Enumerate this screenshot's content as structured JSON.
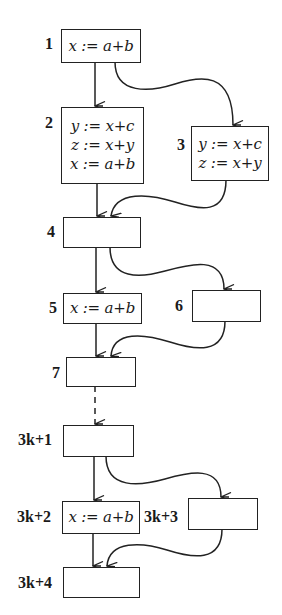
{
  "diagram": {
    "type": "control-flow-graph",
    "colors": {
      "stroke": "#222222",
      "background": "#ffffff",
      "text": "#1a1a1a"
    },
    "blocks": [
      {
        "id": "1",
        "label": "1",
        "statements": [
          "x := a+b"
        ]
      },
      {
        "id": "2",
        "label": "2",
        "statements": [
          "y := x+c",
          "z := x+y",
          "x := a+b"
        ]
      },
      {
        "id": "3",
        "label": "3",
        "statements": [
          "y := x+c",
          "z := x+y"
        ]
      },
      {
        "id": "4",
        "label": "4",
        "statements": []
      },
      {
        "id": "5",
        "label": "5",
        "statements": [
          "x := a+b"
        ]
      },
      {
        "id": "6",
        "label": "6",
        "statements": []
      },
      {
        "id": "7",
        "label": "7",
        "statements": []
      },
      {
        "id": "3k+1",
        "label": "3k+1",
        "statements": []
      },
      {
        "id": "3k+2",
        "label": "3k+2",
        "statements": [
          "x := a+b"
        ]
      },
      {
        "id": "3k+3",
        "label": "3k+3",
        "statements": []
      },
      {
        "id": "3k+4",
        "label": "3k+4",
        "statements": []
      }
    ],
    "edges": [
      {
        "from": "1",
        "to": "2",
        "style": "solid"
      },
      {
        "from": "1",
        "to": "3",
        "style": "solid"
      },
      {
        "from": "2",
        "to": "4",
        "style": "solid"
      },
      {
        "from": "3",
        "to": "4",
        "style": "solid"
      },
      {
        "from": "4",
        "to": "5",
        "style": "solid"
      },
      {
        "from": "4",
        "to": "6",
        "style": "solid"
      },
      {
        "from": "5",
        "to": "7",
        "style": "solid"
      },
      {
        "from": "6",
        "to": "7",
        "style": "solid"
      },
      {
        "from": "7",
        "to": "3k+1",
        "style": "dashed"
      },
      {
        "from": "3k+1",
        "to": "3k+2",
        "style": "solid"
      },
      {
        "from": "3k+1",
        "to": "3k+3",
        "style": "solid"
      },
      {
        "from": "3k+2",
        "to": "3k+4",
        "style": "solid"
      },
      {
        "from": "3k+3",
        "to": "3k+4",
        "style": "solid"
      }
    ]
  }
}
